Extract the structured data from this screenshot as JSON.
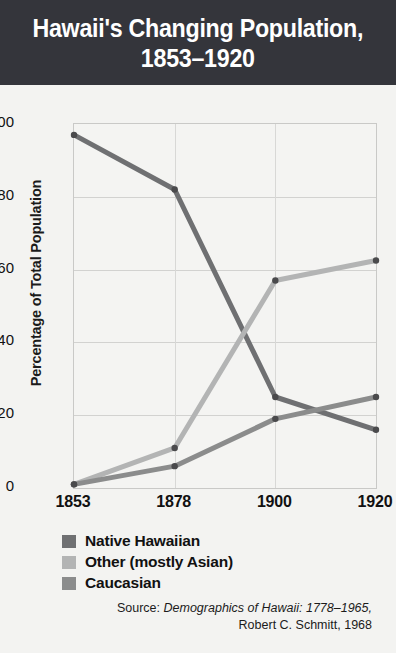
{
  "header": {
    "title_line1": "Hawaii's Changing Population,",
    "title_line2": "1853–1920"
  },
  "source": {
    "prefix": "Source: ",
    "work": "Demographics of Hawaii: 1778–1965,",
    "author": "Robert C. Schmitt, 1968"
  },
  "colors": {
    "header_bg": "#34353b",
    "page_bg": "#f3f3f1",
    "native_hawaiian": "#6f7072",
    "other_asian": "#b3b4b4",
    "caucasian": "#8b8c8c",
    "grid": "#d2d2d0",
    "text": "#111111"
  },
  "chart_data": {
    "type": "line",
    "title": "Hawaii's Changing Population, 1853–1920",
    "xlabel": "",
    "ylabel": "Percentage of Total Population",
    "categories": [
      "1853",
      "1878",
      "1900",
      "1920"
    ],
    "x": [
      1853,
      1878,
      1900,
      1920
    ],
    "ylim": [
      0,
      100
    ],
    "yticks": [
      0,
      20,
      40,
      60,
      80,
      100
    ],
    "ytick_labels": [
      "0",
      "20",
      "40",
      "60",
      "80",
      "100"
    ],
    "grid": true,
    "legend_position": "below-axes-left",
    "markers": true,
    "series": [
      {
        "name": "Native Hawaiian",
        "color": "#6f7072",
        "values": [
          97,
          82,
          25,
          16
        ]
      },
      {
        "name": "Other (mostly Asian)",
        "color": "#b3b4b4",
        "values": [
          1,
          11,
          57,
          62.5
        ]
      },
      {
        "name": "Caucasian",
        "color": "#8b8c8c",
        "values": [
          1,
          6,
          19,
          25
        ]
      }
    ]
  }
}
